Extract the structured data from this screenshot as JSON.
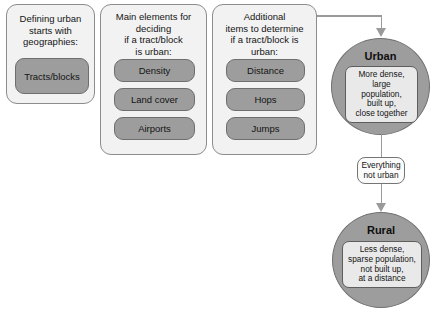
{
  "diagram": {
    "colors": {
      "panel_fill": "#f2f2f2",
      "panel_border": "#8c8c8c",
      "pill_fill": "#9d9d9d",
      "pill_border": "#6e6e6e",
      "circle_fill": "#9d9d9d",
      "note_fill": "#e9e9e9",
      "connector": "#9a9a9a",
      "background": "#ffffff"
    }
  },
  "panels": [
    {
      "id": "geographies",
      "title": "Defining urban\nstarts with\ngeographies:",
      "items": [
        "Tracts/blocks"
      ]
    },
    {
      "id": "main-elements",
      "title": "Main elements for\ndeciding\nif a tract/block\nis urban:",
      "items": [
        "Density",
        "Land cover",
        "Airports"
      ]
    },
    {
      "id": "additional-items",
      "title": "Additional\nitems to determine\nif a tract/block is\nurban:",
      "items": [
        "Distance",
        "Hops",
        "Jumps"
      ]
    }
  ],
  "outcomes": [
    {
      "id": "urban",
      "label": "Urban",
      "note": "More dense,\nlarge\npopulation,\nbuilt up,\nclose together"
    },
    {
      "id": "rural",
      "label": "Rural",
      "note": "Less dense,\nsparse population,\nnot built up,\nat a distance"
    }
  ],
  "edge_labels": [
    {
      "id": "everything-not-urban",
      "text": "Everything\nnot urban"
    }
  ]
}
